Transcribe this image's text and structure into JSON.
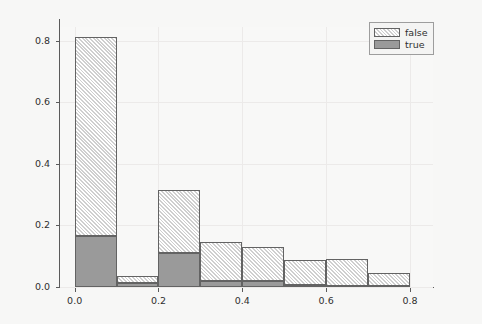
{
  "chart_data": {
    "type": "bar",
    "subtype": "stacked-histogram",
    "title": "",
    "subtitle": "",
    "xlabel": "",
    "ylabel": "",
    "xlim": [
      -0.035,
      0.855
    ],
    "ylim": [
      0.0,
      0.845
    ],
    "grid": true,
    "grid_axes": "both",
    "bin_width": 0.1,
    "bin_edges": [
      0.0,
      0.1,
      0.2,
      0.3,
      0.4,
      0.5,
      0.6,
      0.7,
      0.8
    ],
    "bin_centers": [
      0.05,
      0.15,
      0.25,
      0.35,
      0.45,
      0.55,
      0.65,
      0.75
    ],
    "x_tick_values": [
      0.0,
      0.2,
      0.4,
      0.6,
      0.8
    ],
    "x_tick_labels": [
      "0.0",
      "0.2",
      "0.4",
      "0.6",
      "0.8"
    ],
    "y_tick_values": [
      0.0,
      0.2,
      0.4,
      0.6,
      0.8
    ],
    "y_tick_labels": [
      "0.0",
      "0.2",
      "0.4",
      "0.6",
      "0.8"
    ],
    "stack_order": [
      "true",
      "false"
    ],
    "series": [
      {
        "name": "true",
        "color": "#9a9a9a",
        "hatch": "none",
        "values": [
          0.166,
          0.012,
          0.11,
          0.018,
          0.018,
          0.005,
          0.004,
          0.003
        ]
      },
      {
        "name": "false",
        "color": "#cfcfcf",
        "hatch": "///",
        "values": [
          0.645,
          0.023,
          0.204,
          0.127,
          0.112,
          0.083,
          0.086,
          0.042
        ]
      }
    ],
    "totals": [
      0.811,
      0.035,
      0.314,
      0.145,
      0.13,
      0.088,
      0.09,
      0.045
    ],
    "legend": {
      "position": "upper-right",
      "entries": [
        {
          "label": "false",
          "swatch": "hatched-light-gray"
        },
        {
          "label": "true",
          "swatch": "solid-gray"
        }
      ]
    }
  },
  "legend": {
    "entries": [
      {
        "label": "false"
      },
      {
        "label": "true"
      }
    ]
  },
  "axes": {
    "y_labels": [
      "0.8",
      "0.6",
      "0.4",
      "0.2",
      "0.0"
    ],
    "x_labels": [
      "0.0",
      "0.2",
      "0.4",
      "0.6",
      "0.8"
    ]
  }
}
